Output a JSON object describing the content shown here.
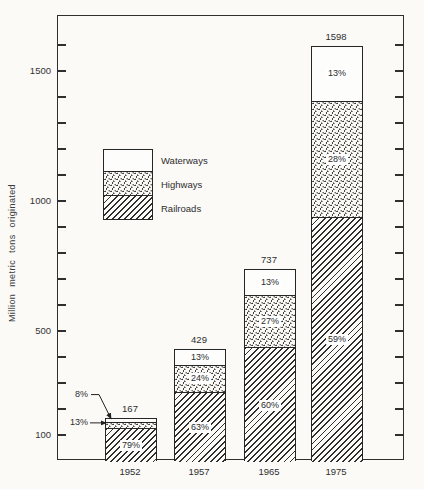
{
  "chart_data": {
    "type": "bar",
    "stacked": true,
    "title": "",
    "xlabel": "",
    "ylabel": "Million metric tons originated",
    "categories": [
      "1952",
      "1957",
      "1965",
      "1975"
    ],
    "totals": [
      167,
      429,
      737,
      1598
    ],
    "series": [
      {
        "name": "Waterways",
        "pattern": "plain",
        "percents": [
          8,
          13,
          13,
          13
        ]
      },
      {
        "name": "Highways",
        "pattern": "stipple",
        "percents": [
          13,
          24,
          27,
          28
        ]
      },
      {
        "name": "Railroads",
        "pattern": "hatch",
        "percents": [
          79,
          63,
          60,
          59
        ]
      }
    ],
    "yaxis": {
      "min": 0,
      "max": 1712,
      "labeled_ticks": [
        100,
        500,
        1000,
        1500
      ],
      "minor_tick_step": 100,
      "ticks_both_sides": true
    },
    "legend": {
      "position": "upper-left-inside",
      "items": [
        "Waterways",
        "Highways",
        "Railroads"
      ]
    },
    "external_labels": [
      {
        "bar": "1952",
        "segment": "Waterways",
        "text": "8%"
      },
      {
        "bar": "1952",
        "segment": "Highways",
        "text": "13%"
      }
    ],
    "colors": {
      "ink": "#2f2f2f",
      "paper": "#fbfaf7",
      "label_bg": "#ffffff"
    }
  }
}
